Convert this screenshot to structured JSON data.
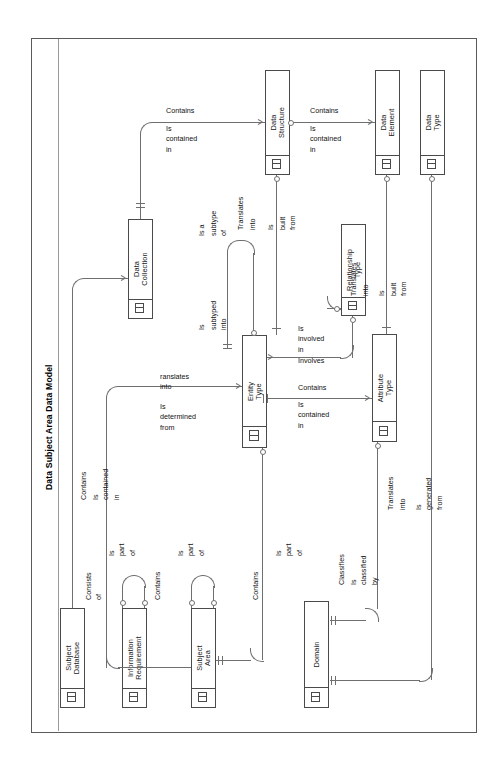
{
  "diagram": {
    "title": "Data Subject Area Data Model",
    "notation": "IDEF1X entity relationship diagram",
    "orientation": "landscape-content-rotated-90-ccw",
    "frame_color": "#5a5a5a",
    "entity_border_color": "#4a4a4a",
    "line_color": "#6f6f6f",
    "background": "#ffffff"
  },
  "entities": [
    {
      "id": "data-structure",
      "name": "Data\nStructure"
    },
    {
      "id": "data-element",
      "name": "Data\nElement"
    },
    {
      "id": "data-type",
      "name": "Data\nType"
    },
    {
      "id": "data-collection",
      "name": "Data\nCollection"
    },
    {
      "id": "relationship-type",
      "name": "Relationship\nType"
    },
    {
      "id": "entity-type",
      "name": "Entity\nType"
    },
    {
      "id": "attribute-type",
      "name": "Attribute\nType"
    },
    {
      "id": "subject-database",
      "name": "Subject\nDatabase"
    },
    {
      "id": "information-requirement",
      "name": "Information\nRequirement"
    },
    {
      "id": "subject-area",
      "name": "Subject\nArea"
    },
    {
      "id": "domain",
      "name": "Domain"
    }
  ],
  "relationships": [
    {
      "id": "r-datacollection-datastructure",
      "verb": "Contains",
      "inverse": "Is\ncontained\nin"
    },
    {
      "id": "r-datastructure-dataelement",
      "verb": "Contains",
      "inverse": "Is\ncontained\nin"
    },
    {
      "id": "r-entitytype-datastructure",
      "verb": "Translates",
      "inverse": "into"
    },
    {
      "id": "r-datastructure-built",
      "verb": "Is",
      "inverse": "built\nfrom"
    },
    {
      "id": "r-entitytype-subtype",
      "verb": "Is a",
      "inverse": "subtype\nof"
    },
    {
      "id": "r-entitytype-subtyped",
      "verb": "Is",
      "inverse": "subtyped\ninto"
    },
    {
      "id": "r-relationshiptype-translates",
      "verb": "Translates",
      "inverse": "into"
    },
    {
      "id": "r-relationshiptype-built",
      "verb": "Is",
      "inverse": "built\nfrom"
    },
    {
      "id": "r-entitytype-involved",
      "verb": "Is\ninvolved\nin",
      "inverse": "Involves"
    },
    {
      "id": "r-entitytype-attributetype",
      "verb": "Contains",
      "inverse": "Is\ncontained\nin"
    },
    {
      "id": "r-subjectarea-entitytype",
      "verb": "ranslates\ninto",
      "inverse": "Is\ndetermined\nfrom"
    },
    {
      "id": "r-subjectdatabase-contains",
      "verb": "Contains",
      "inverse": "Is\ncontained\nin"
    },
    {
      "id": "r-inforequirement-consists",
      "verb": "Consists\nof",
      "inverse": "Is\npart\nof"
    },
    {
      "id": "r-subjectarea-contains",
      "verb": "Contains",
      "inverse": "Is\npart\nof"
    },
    {
      "id": "r-entitytype-contains-part",
      "verb": "Contains",
      "inverse": "Is\npart\nof"
    },
    {
      "id": "r-domain-classifies",
      "verb": "Classifies",
      "inverse": "Is\nclassified\nby"
    },
    {
      "id": "r-attributetype-translates",
      "verb": "Translates",
      "inverse": "into"
    },
    {
      "id": "r-datatype-generated",
      "verb": "Is",
      "inverse": "generated\nfrom"
    }
  ],
  "labels": {
    "contains": "Contains",
    "is_contained_in": "Is\ncontained\nin",
    "translates": "Translates",
    "into": "into",
    "is": "Is",
    "built_from": "built\nfrom",
    "is_a": "Is a",
    "subtype_of": "subtype\nof",
    "subtyped_into": "subtyped\ninto",
    "is_involved_in": "Is\ninvolved\nin",
    "involves": "Involves",
    "ranslates_into": "ranslates\ninto",
    "is_determined_from": "Is\ndetermined\nfrom",
    "consists_of": "Consists\nof",
    "is_part_of": "Is\npart\nof",
    "classifies": "Classifies",
    "is_classified_by": "Is\nclassified\nby",
    "is_generated_from": "Is\ngenerated\nfrom"
  }
}
